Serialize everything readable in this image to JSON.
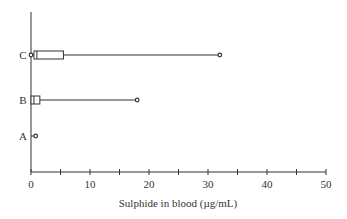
{
  "chart_data": {
    "type": "boxplot",
    "orientation": "horizontal",
    "title": "",
    "xlabel": "Sulphide in blood (µg/mL)",
    "ylabel": "",
    "xlim": [
      0,
      50
    ],
    "xticks": [
      0,
      5,
      10,
      15,
      20,
      25,
      30,
      35,
      40,
      45,
      50
    ],
    "xtick_labels": [
      "0",
      "10",
      "20",
      "30",
      "40",
      "50"
    ],
    "grid": false,
    "legend": null,
    "categories": [
      "C",
      "B",
      "A"
    ],
    "series": [
      {
        "name": "C",
        "min": 0.0,
        "q1": 0.5,
        "median": 1.0,
        "q3": 5.5,
        "max": 32.0,
        "outliers": [
          0.0,
          32.0
        ]
      },
      {
        "name": "B",
        "min": 0.0,
        "q1": 0.0,
        "median": 0.5,
        "q3": 1.5,
        "max": 18.0,
        "outliers": [
          18.0
        ]
      },
      {
        "name": "A",
        "min": 0.0,
        "q1": 0.8,
        "median": 0.8,
        "q3": 0.8,
        "max": 0.8,
        "outliers": [
          0.8
        ]
      }
    ],
    "colors": {
      "line": "#333333",
      "background": "#ffffff"
    }
  }
}
